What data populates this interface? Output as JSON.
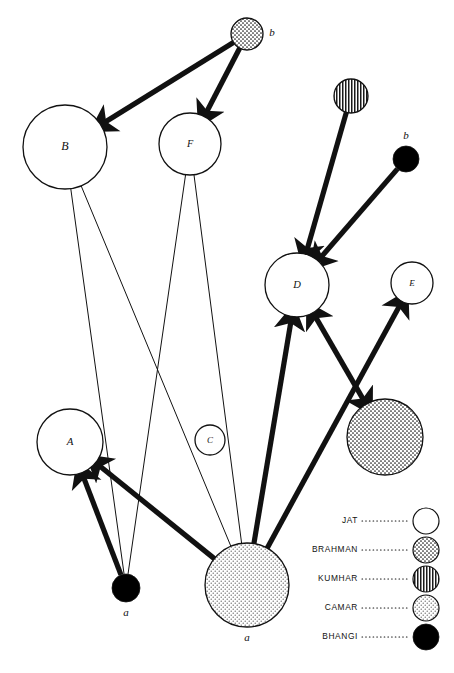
{
  "figure": {
    "type": "network-diagram",
    "width": 454,
    "height": 673,
    "background": "#ffffff",
    "stroke": "#111111"
  },
  "patterns": {
    "jat": {
      "name": "JAT",
      "fill": "#ffffff",
      "style": "solid-white"
    },
    "brahman": {
      "name": "BRAHMAN",
      "fill": "#f0f0f0",
      "style": "fine-dot-stipple"
    },
    "kumhar": {
      "name": "KUMHAR",
      "fill": "#d8d8d8",
      "style": "vertical-stripes"
    },
    "camar": {
      "name": "CAMAR",
      "fill": "#e2e2e2",
      "style": "coarse-stipple"
    },
    "bhangi": {
      "name": "BHANGI",
      "fill": "#000000",
      "style": "solid-black"
    }
  },
  "nodes": [
    {
      "id": "brahman-top",
      "label": "b",
      "label_pos": "right",
      "caste": "brahman",
      "cx": 247,
      "cy": 34,
      "r": 16
    },
    {
      "id": "B",
      "label": "B",
      "label_pos": "center",
      "caste": "jat",
      "cx": 65,
      "cy": 147,
      "r": 42
    },
    {
      "id": "F",
      "label": "F",
      "label_pos": "center",
      "caste": "jat",
      "cx": 190,
      "cy": 144,
      "r": 31
    },
    {
      "id": "kumhar-top",
      "label": "",
      "label_pos": "none",
      "caste": "kumhar",
      "cx": 351,
      "cy": 96,
      "r": 17
    },
    {
      "id": "bhangi-right",
      "label": "b",
      "label_pos": "top",
      "caste": "bhangi",
      "cx": 406,
      "cy": 159,
      "r": 13
    },
    {
      "id": "D",
      "label": "D",
      "label_pos": "center",
      "caste": "jat",
      "cx": 297,
      "cy": 285,
      "r": 32
    },
    {
      "id": "E",
      "label": "E",
      "label_pos": "center",
      "caste": "jat",
      "cx": 412,
      "cy": 283,
      "r": 21
    },
    {
      "id": "brahman-mid",
      "label": "",
      "label_pos": "none",
      "caste": "brahman",
      "cx": 385,
      "cy": 437,
      "r": 38
    },
    {
      "id": "A",
      "label": "A",
      "label_pos": "center",
      "caste": "jat",
      "cx": 70,
      "cy": 442,
      "r": 33
    },
    {
      "id": "C",
      "label": "C",
      "label_pos": "center",
      "caste": "jat",
      "cx": 210,
      "cy": 440,
      "r": 15
    },
    {
      "id": "bhangi-bottom",
      "label": "a",
      "label_pos": "bottom",
      "caste": "bhangi",
      "cx": 126,
      "cy": 588,
      "r": 14
    },
    {
      "id": "camar-bottom",
      "label": "a",
      "label_pos": "bottom",
      "caste": "camar",
      "cx": 247,
      "cy": 585,
      "r": 42
    }
  ],
  "edges": [
    {
      "from": "brahman-top",
      "to": "B",
      "weight": "thick",
      "arrow": "end"
    },
    {
      "from": "brahman-top",
      "to": "F",
      "weight": "thick",
      "arrow": "end"
    },
    {
      "from": "kumhar-top",
      "to": "D",
      "weight": "thick",
      "arrow": "end"
    },
    {
      "from": "bhangi-right",
      "to": "D",
      "weight": "thick",
      "arrow": "end"
    },
    {
      "from": "camar-bottom",
      "to": "D",
      "weight": "thick",
      "arrow": "end"
    },
    {
      "from": "camar-bottom",
      "to": "E",
      "weight": "thick",
      "arrow": "end"
    },
    {
      "from": "camar-bottom",
      "to": "A",
      "weight": "thick",
      "arrow": "end"
    },
    {
      "from": "bhangi-bottom",
      "to": "A",
      "weight": "thick",
      "arrow": "end"
    },
    {
      "from": "brahman-mid",
      "to": "D",
      "weight": "thick",
      "arrow": "both"
    },
    {
      "from": "B",
      "to": "bhangi-bottom",
      "weight": "thin",
      "arrow": "none"
    },
    {
      "from": "B",
      "to": "camar-bottom",
      "weight": "thin",
      "arrow": "none"
    },
    {
      "from": "F",
      "to": "bhangi-bottom",
      "weight": "thin",
      "arrow": "none"
    },
    {
      "from": "F",
      "to": "camar-bottom",
      "weight": "thin",
      "arrow": "none"
    }
  ],
  "legend": {
    "items": [
      {
        "label": "JAT",
        "caste": "jat"
      },
      {
        "label": "BRAHMAN",
        "caste": "brahman"
      },
      {
        "label": "KUMHAR",
        "caste": "kumhar"
      },
      {
        "label": "CAMAR",
        "caste": "camar"
      },
      {
        "label": "BHANGI",
        "caste": "bhangi"
      }
    ]
  }
}
